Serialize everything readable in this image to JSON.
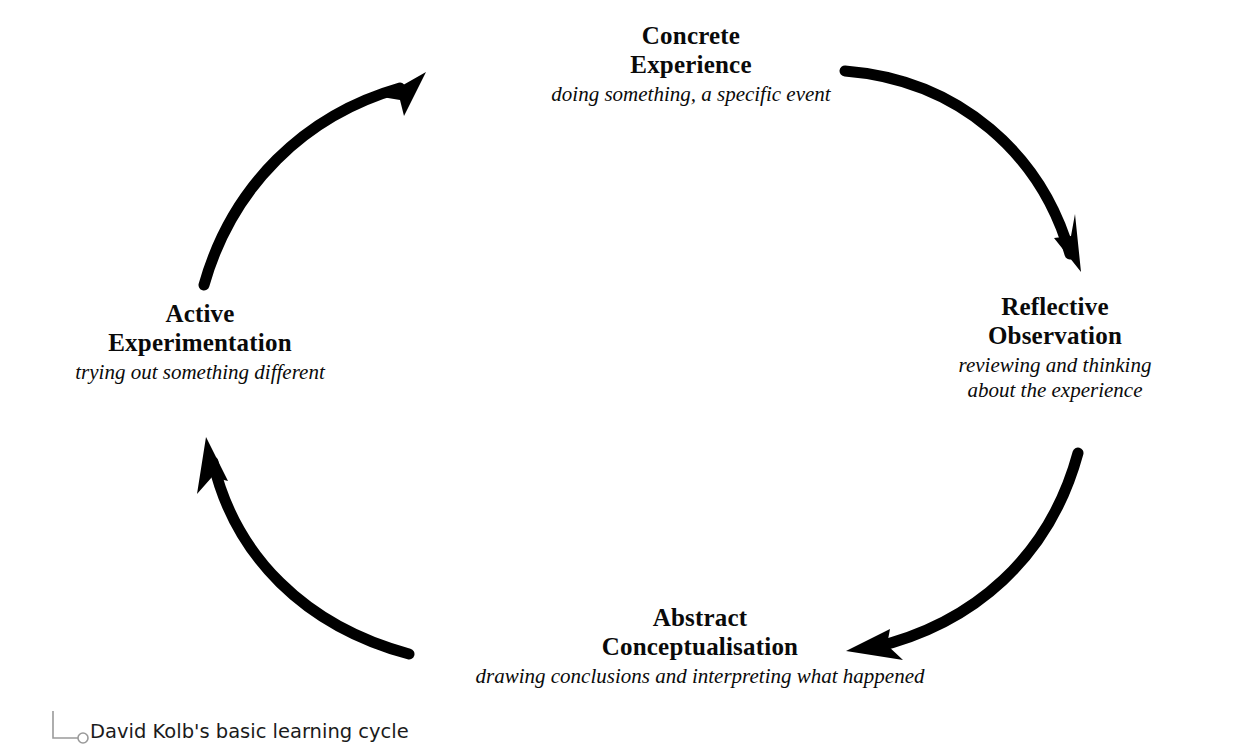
{
  "diagram": {
    "kind": "cycle",
    "caption": "David Kolb's basic learning cycle",
    "background_color": "#ffffff",
    "stroke_color": "#000000",
    "leader_color": "#9a9a9a",
    "nodes": [
      {
        "id": "concrete-experience",
        "title": "Concrete\nExperience",
        "subtitle": "doing something, a specific event",
        "position": "top"
      },
      {
        "id": "reflective-observation",
        "title": "Reflective\nObservation",
        "subtitle": "reviewing and thinking\nabout the experience",
        "position": "right"
      },
      {
        "id": "abstract-conceptualisation",
        "title": "Abstract\nConceptualisation",
        "subtitle": "drawing conclusions and interpreting what happened",
        "position": "bottom"
      },
      {
        "id": "active-experimentation",
        "title": "Active\nExperimentation",
        "subtitle": "trying out something different",
        "position": "left"
      }
    ],
    "arrows": [
      {
        "id": "arrow-top-right",
        "from": "concrete-experience",
        "to": "reflective-observation",
        "direction": "clockwise"
      },
      {
        "id": "arrow-bottom-right",
        "from": "reflective-observation",
        "to": "abstract-conceptualisation",
        "direction": "clockwise"
      },
      {
        "id": "arrow-bottom-left",
        "from": "abstract-conceptualisation",
        "to": "active-experimentation",
        "direction": "clockwise"
      },
      {
        "id": "arrow-top-left",
        "from": "active-experimentation",
        "to": "concrete-experience",
        "direction": "clockwise"
      }
    ]
  }
}
